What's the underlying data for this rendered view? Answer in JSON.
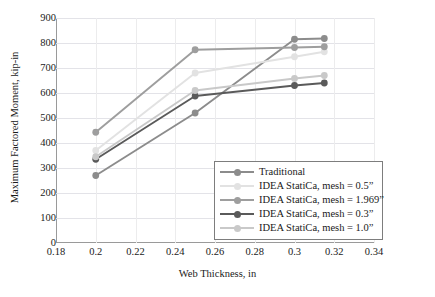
{
  "chart_data": {
    "type": "line",
    "title": "",
    "xlabel": "Web Thickness, in",
    "ylabel": "Maximum Factored Moment, kip-in",
    "xlim": [
      0.18,
      0.34
    ],
    "ylim": [
      0,
      900
    ],
    "xticks": [
      "0.18",
      "0.2",
      "0.22",
      "0.24",
      "0.26",
      "0.28",
      "0.3",
      "0.32",
      "0.34"
    ],
    "xtick_values": [
      0.18,
      0.2,
      0.22,
      0.24,
      0.26,
      0.28,
      0.3,
      0.32,
      0.34
    ],
    "yticks": [
      "0",
      "100",
      "200",
      "300",
      "400",
      "500",
      "600",
      "700",
      "800",
      "900"
    ],
    "ytick_values": [
      0,
      100,
      200,
      300,
      400,
      500,
      600,
      700,
      800,
      900
    ],
    "grid": "horizontal-and-vertical",
    "legend_position": "inside-lower-right",
    "x": [
      0.2,
      0.25,
      0.3,
      0.315
    ],
    "series": [
      {
        "name": "Traditional",
        "color": "#8c8c8c",
        "values": [
          270,
          520,
          815,
          818
        ]
      },
      {
        "name": "IDEA StatiCa, mesh = 0.5”",
        "color": "#e2e2e2",
        "values": [
          370,
          680,
          745,
          765
        ]
      },
      {
        "name": "IDEA StatiCa, mesh = 1.969”",
        "color": "#9e9e9e",
        "values": [
          443,
          773,
          782,
          785
        ]
      },
      {
        "name": "IDEA StatiCa, mesh = 0.3”",
        "color": "#5a5a5a",
        "values": [
          335,
          588,
          630,
          640
        ]
      },
      {
        "name": "IDEA StatiCa, mesh = 1.0”",
        "color": "#c9c9c9",
        "values": [
          345,
          610,
          658,
          670
        ]
      }
    ]
  }
}
